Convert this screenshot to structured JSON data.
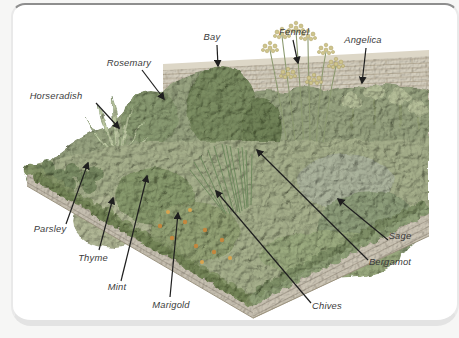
{
  "page": {
    "background": "#f6f6f5",
    "frame_fill": "#ffffff",
    "frame_top_border": "#8e8e8e",
    "frame_light_border": "#e3e3e3"
  },
  "figure": {
    "type": "labeled-herb-garden-illustration",
    "labels": {
      "bay": "Bay",
      "fennel": "Fennel",
      "angelica": "Angelica",
      "rosemary": "Rosemary",
      "horseradish": "Horseradish",
      "parsley": "Parsley",
      "thyme": "Thyme",
      "mint": "Mint",
      "marigold": "Marigold",
      "chives": "Chives",
      "bergamot": "Bergamot",
      "sage": "Sage"
    },
    "colors": {
      "arrow_and_text": "#2a2a2a",
      "wall_brick": "#d5cfbf",
      "wall_mortar": "#ab9f8a",
      "bed_brick": "#c8c1b2",
      "foliage_base": "#a7b08e",
      "foliage_dark": "#7f9068",
      "marigold_flower": "#c3873e",
      "fennel_flower": "#cfc58c"
    }
  }
}
